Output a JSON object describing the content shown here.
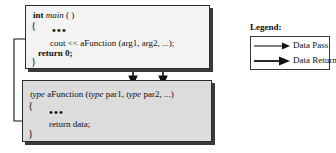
{
  "diagram": {
    "colors": {
      "main_box_fill": "#f3f3f3",
      "function_box_fill": "#dcdcdc",
      "border": "#2b2b2b",
      "shadow": "#3a3a3a",
      "text": "#0f0f0f",
      "legend_border": "#3a3a3a"
    }
  },
  "main_box": {
    "name": "main-function-block",
    "signature_keyword": "int",
    "signature_name": "main",
    "signature_params": "( )",
    "open_brace": "{",
    "ellipsis": "•••",
    "call_statement": "cout << aFunction (arg1, arg2, ...);",
    "return_statement": "return 0;",
    "close_brace": "}"
  },
  "function_box": {
    "name": "afunction-definition-block",
    "return_type": "type",
    "function_name": "aFunction",
    "param1_type": "type",
    "param1_name": "par1",
    "param2_type": "type",
    "param2_name": "par2",
    "param_ellipsis": "...",
    "signature_open_paren": "(",
    "signature_close_paren": ")",
    "signature_comma": ",",
    "open_brace": "{",
    "ellipsis": "•••",
    "return_statement": "return  data;",
    "close_brace": "}"
  },
  "legend": {
    "title": "Legend:",
    "items": [
      {
        "label": "Data Pass",
        "icon": "thin-arrow-right-icon"
      },
      {
        "label": "Data Return",
        "icon": "thick-arrow-right-icon"
      }
    ]
  },
  "connectors": {
    "data_pass_arg1": "arg1-to-par1-arrow",
    "data_pass_arg2": "arg2-to-par2-arrow",
    "data_return": "return-data-to-cout-arrow"
  }
}
